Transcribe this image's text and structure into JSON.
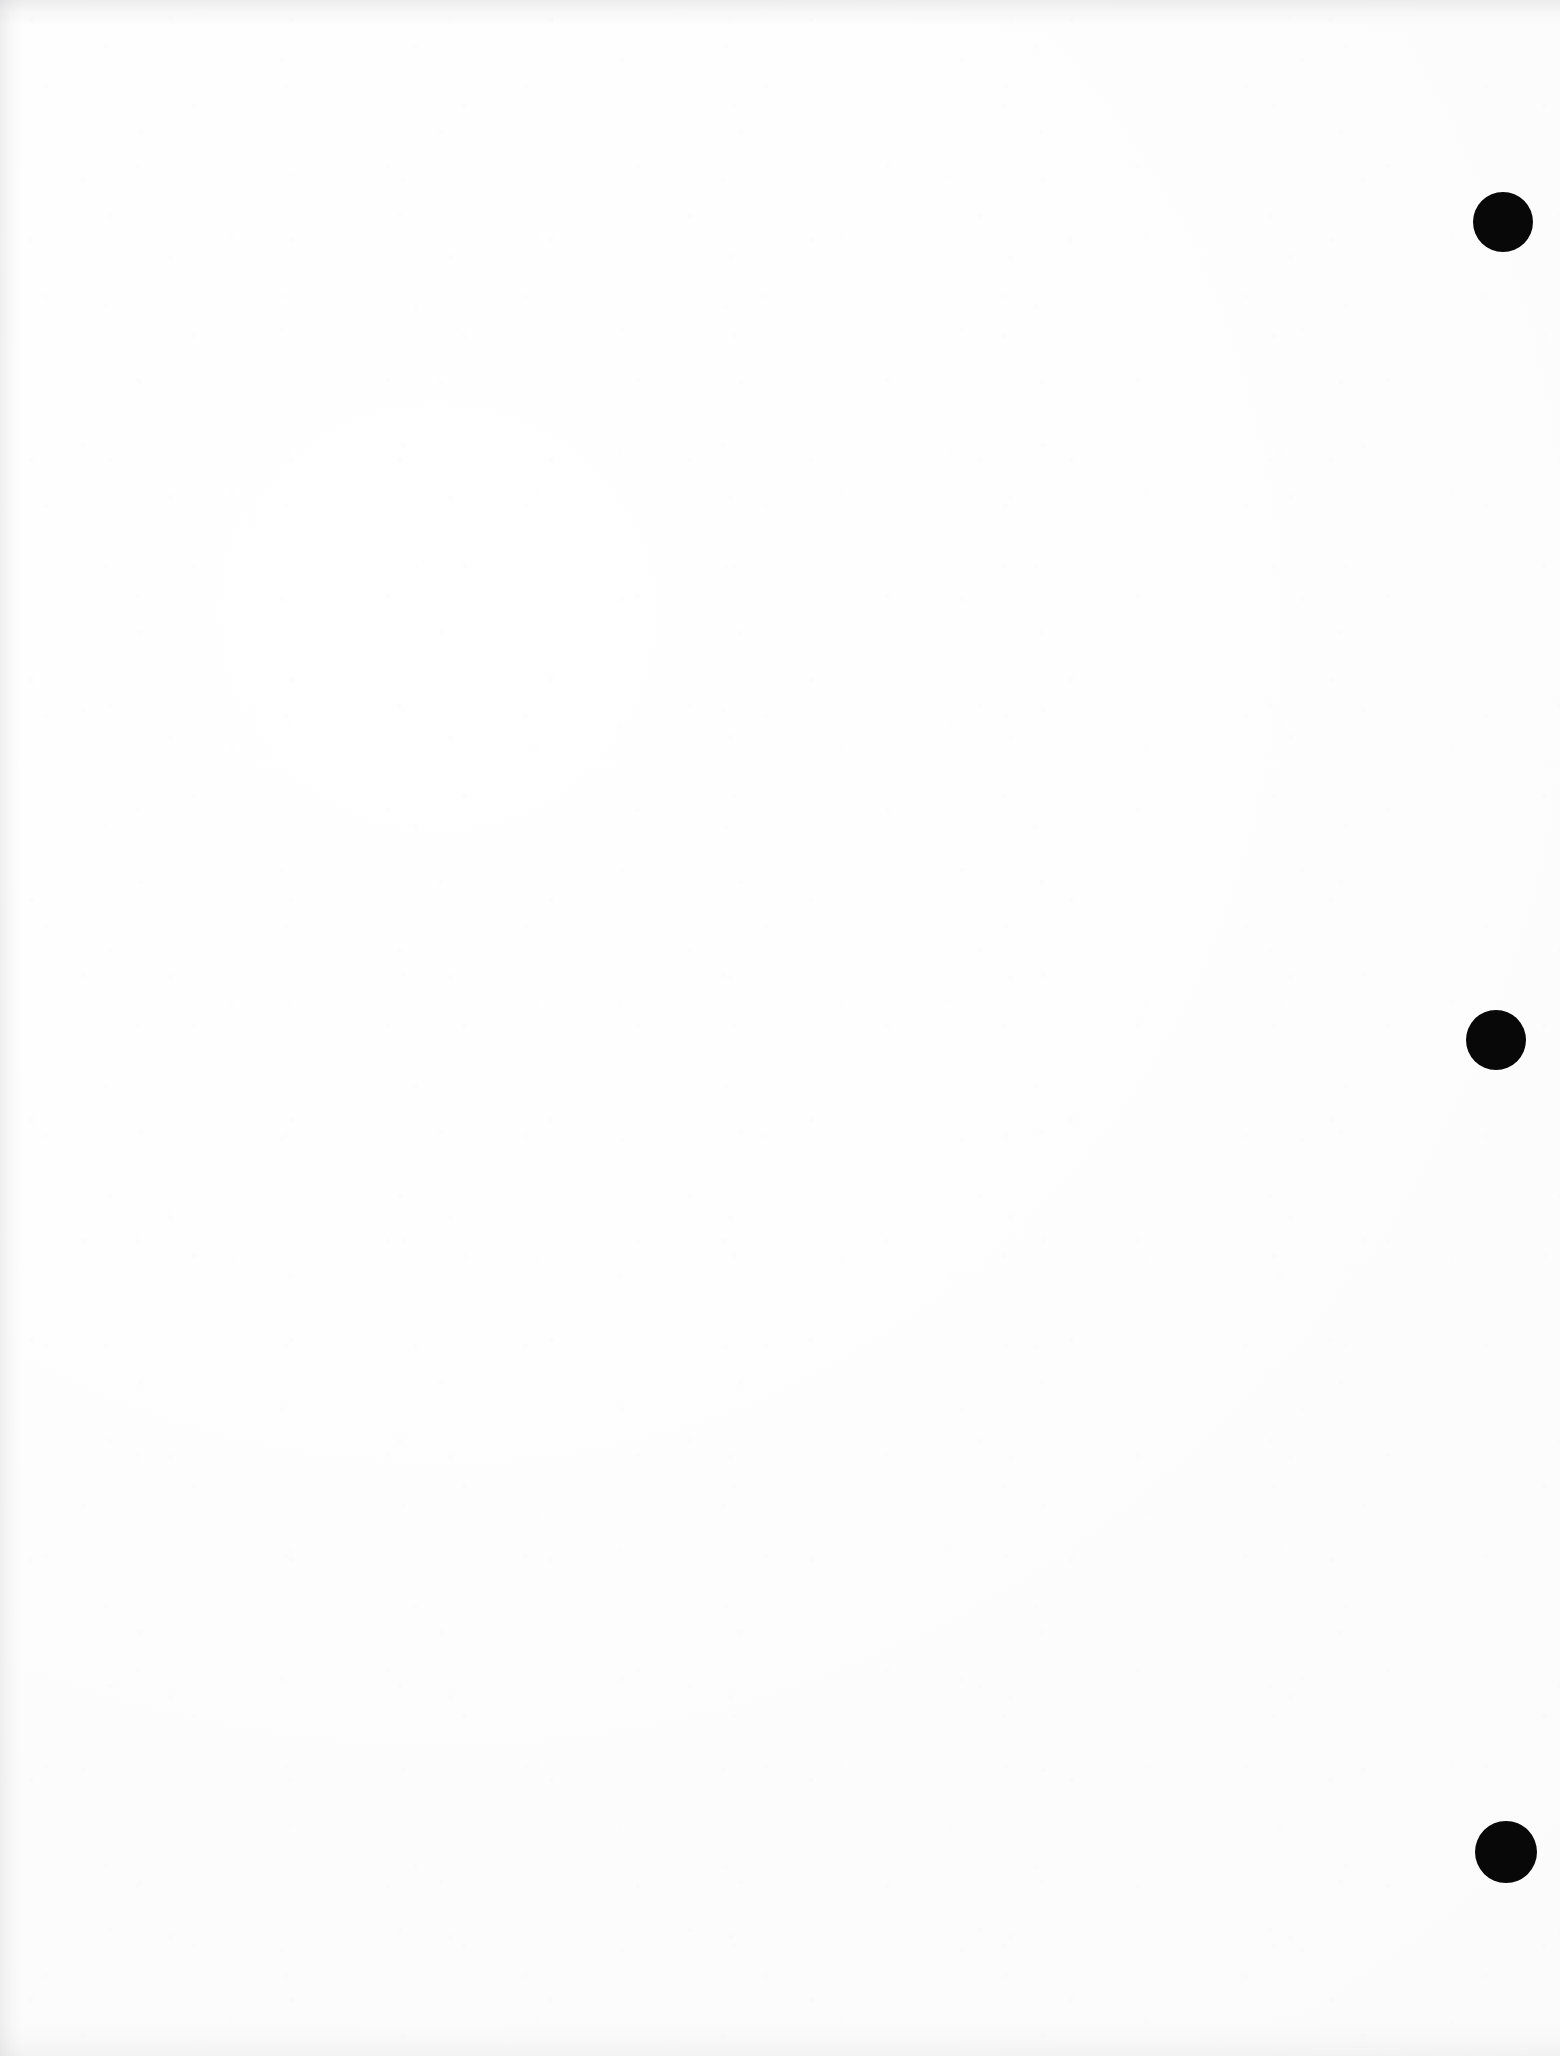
{
  "page": {
    "kind": "scanned-document-page",
    "width": 1560,
    "height": 2056,
    "paper_color": "#fdfdfd",
    "ink_color": "#080808",
    "text_content": "",
    "visible_text_blocks": []
  },
  "marks": {
    "punch_holes": [
      {
        "name": "punch-hole-top",
        "cx": 1503,
        "cy": 222,
        "diameter": 60,
        "color": "#080808"
      },
      {
        "name": "punch-hole-middle",
        "cx": 1496,
        "cy": 1040,
        "diameter": 60,
        "color": "#080808"
      },
      {
        "name": "punch-hole-bottom",
        "cx": 1506,
        "cy": 1852,
        "diameter": 62,
        "color": "#080808"
      }
    ]
  },
  "artifacts": {
    "top_edge_shadow": true,
    "left_edge_shadow": true,
    "bottom_edge_shadow": true,
    "paper_grain": true
  }
}
